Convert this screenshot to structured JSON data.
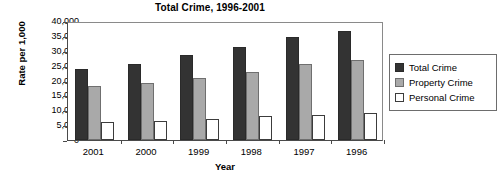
{
  "chart_data": {
    "type": "bar",
    "title": "Total Crime, 1996-2001",
    "xlabel": "Year",
    "ylabel": "Rate per 1,000",
    "categories": [
      "2001",
      "2000",
      "1999",
      "1998",
      "1997",
      "1996"
    ],
    "series": [
      {
        "name": "Total Crime",
        "color": "#333333",
        "values": [
          24000,
          25700,
          28500,
          31200,
          34500,
          36500
        ]
      },
      {
        "name": "Property Crime",
        "color": "#a9a9a9",
        "values": [
          18200,
          19200,
          21000,
          22700,
          25500,
          27000
        ]
      },
      {
        "name": "Personal Crime",
        "color": "#ffffff",
        "values": [
          5900,
          6300,
          7200,
          8000,
          8500,
          9000
        ]
      }
    ],
    "ylim": [
      0,
      40000
    ],
    "ytick_labels": [
      "40,000",
      "35,000",
      "30,000",
      "25,000",
      "20,000",
      "15,000",
      "10,000",
      "5,000",
      "0"
    ],
    "ytick_values": [
      40000,
      35000,
      30000,
      25000,
      20000,
      15000,
      10000,
      5000,
      0
    ],
    "grid": false,
    "legend_position": "right"
  }
}
